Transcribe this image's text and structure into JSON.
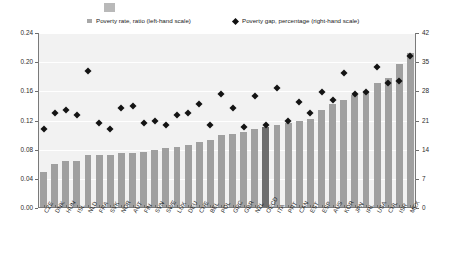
{
  "legend": {
    "rate_label": "Poverty rate, ratio (left-hand scale)",
    "gap_label": "Poverty gap, percentage (right-hand scale)",
    "rate_marker": "square-swatch-icon",
    "gap_marker": "diamond-marker-icon"
  },
  "axes": {
    "left_ticks": [
      "0.24",
      "0.20",
      "0.16",
      "0.12",
      "0.08",
      "0.04",
      "0.00"
    ],
    "right_ticks": [
      "42",
      "35",
      "28",
      "21",
      "14",
      "7",
      "0"
    ]
  },
  "colors": {
    "bar": "#a0a0a0",
    "bar_highlight": "#6e6e6e",
    "marker": "#141414",
    "plot_background": "#f2f2f2",
    "gridline": "#ffffff",
    "axis": "#7a7a7a"
  },
  "chart_data": {
    "type": "bar",
    "title": "",
    "subtitle": "",
    "xlabel": "",
    "ylabel": "",
    "ylim": [
      0,
      0.24
    ],
    "y2lim": [
      0,
      42
    ],
    "grid": true,
    "legend_position": "top",
    "highlight_category": "OECD",
    "categories": [
      "CZE",
      "DNK",
      "HUN",
      "ISL",
      "NLD",
      "FRA",
      "SVK",
      "NOR",
      "AUT",
      "FIN",
      "SVN",
      "SWE",
      "LUX",
      "DEU",
      "CHE",
      "BEL",
      "POL",
      "GRC",
      "GBR",
      "NZL",
      "OECD",
      "ITA",
      "PRT",
      "CAN",
      "EST",
      "ESP",
      "AUS",
      "KOR",
      "JPN",
      "IRL",
      "USA",
      "CHL",
      "ISR",
      "MEX"
    ],
    "series": [
      {
        "name": "Poverty rate, ratio (left-hand scale)",
        "axis": "left",
        "type": "bar",
        "values": [
          0.049,
          0.06,
          0.064,
          0.065,
          0.073,
          0.073,
          0.073,
          0.076,
          0.076,
          0.077,
          0.08,
          0.082,
          0.084,
          0.087,
          0.09,
          0.093,
          0.1,
          0.102,
          0.104,
          0.108,
          0.111,
          0.114,
          0.117,
          0.119,
          0.122,
          0.135,
          0.143,
          0.148,
          0.155,
          0.16,
          0.172,
          0.178,
          0.198,
          0.212
        ]
      },
      {
        "name": "Poverty gap, percentage (right-hand scale)",
        "axis": "right",
        "type": "scatter",
        "values": [
          19.5,
          23.5,
          24.0,
          23.0,
          33.5,
          21.0,
          19.5,
          24.5,
          25.0,
          21.0,
          21.5,
          20.5,
          23.0,
          23.5,
          25.5,
          20.5,
          28.0,
          24.5,
          20.0,
          27.5,
          20.5,
          29.5,
          21.5,
          26.0,
          23.5,
          28.5,
          26.5,
          33.0,
          28.0,
          28.5,
          34.5,
          30.5,
          31.0,
          37.0
        ]
      }
    ]
  }
}
